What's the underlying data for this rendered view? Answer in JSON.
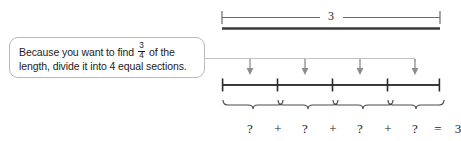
{
  "diagram": {
    "callout": {
      "line1_pre": "Because you want to find",
      "fraction": {
        "numerator": "3",
        "denominator": "4"
      },
      "line1_post": "of the",
      "line2": "length, divide it into 4 equal sections."
    },
    "top_bracket": {
      "label": "3",
      "left_cap": "tick",
      "right_cap": "tick"
    },
    "arrows": {
      "count": 4,
      "direction": "down"
    },
    "number_line": {
      "tick_count": 5,
      "section_count": 4
    },
    "braces": {
      "count": 4
    },
    "equation": {
      "tokens": [
        "?",
        "+",
        "?",
        "+",
        "?",
        "+",
        "?",
        "=",
        "3"
      ]
    },
    "colors": {
      "ink": "#1b1b1b",
      "rule": "#3a3a3a",
      "light_rule": "#b0b0b0",
      "callout_border": "#b9b9b9",
      "background": "#ffffff"
    }
  }
}
